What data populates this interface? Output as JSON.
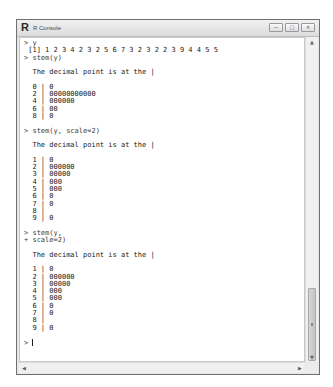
{
  "window": {
    "title": "R Console",
    "logo": "R",
    "controls": {
      "minimize": "—",
      "maximize": "□",
      "close": "✕"
    }
  },
  "console": {
    "lines": [
      {
        "type": "input",
        "text": "> y"
      },
      {
        "type": "output",
        "text": " [1] 1 2 3 4 2 3 2 5 6 7 3 2 3 2 2 3 9 4 4 5 5"
      },
      {
        "type": "input",
        "text": "> stem(y)"
      },
      {
        "type": "blank",
        "text": ""
      },
      {
        "type": "output",
        "text": "  The decimal point is at the |"
      },
      {
        "type": "blank",
        "text": ""
      },
      {
        "type": "output",
        "text": "  0 | 0"
      },
      {
        "type": "output",
        "text": "  2 | 00000000000"
      },
      {
        "type": "output",
        "text": "  4 | 000000"
      },
      {
        "type": "output",
        "text": "  6 | 00"
      },
      {
        "type": "output",
        "text": "  8 | 0"
      },
      {
        "type": "blank",
        "text": ""
      },
      {
        "type": "input",
        "text": "> stem(y, scale=2)"
      },
      {
        "type": "blank",
        "text": ""
      },
      {
        "type": "output",
        "text": "  The decimal point is at the |"
      },
      {
        "type": "blank",
        "text": ""
      },
      {
        "type": "output",
        "text": "  1 | 0"
      },
      {
        "type": "output",
        "text": "  2 | 000000"
      },
      {
        "type": "output",
        "text": "  3 | 00000"
      },
      {
        "type": "output",
        "text": "  4 | 000"
      },
      {
        "type": "output",
        "text": "  5 | 000"
      },
      {
        "type": "output",
        "text": "  6 | 0"
      },
      {
        "type": "output",
        "text": "  7 | 0"
      },
      {
        "type": "output",
        "text": "  8 |"
      },
      {
        "type": "output",
        "text": "  9 | 0"
      },
      {
        "type": "blank",
        "text": ""
      },
      {
        "type": "input",
        "text": "> stem(y,"
      },
      {
        "type": "input",
        "text": "+ scale=2)"
      },
      {
        "type": "blank",
        "text": ""
      },
      {
        "type": "output",
        "text": "  The decimal point is at the |"
      },
      {
        "type": "blank",
        "text": ""
      },
      {
        "type": "output",
        "text": "  1 | 0"
      },
      {
        "type": "output",
        "text": "  2 | 000000"
      },
      {
        "type": "output",
        "text": "  3 | 00000"
      },
      {
        "type": "output",
        "text": "  4 | 000"
      },
      {
        "type": "output",
        "text": "  5 | 000"
      },
      {
        "type": "output",
        "text": "  6 | 0"
      },
      {
        "type": "output",
        "text": "  7 | 0"
      },
      {
        "type": "output",
        "text": "  8 |"
      },
      {
        "type": "output",
        "text": "  9 | 0"
      },
      {
        "type": "blank",
        "text": ""
      }
    ],
    "prompt": "> "
  },
  "scrollbars": {
    "up": "▲",
    "down": "▼",
    "left": "◀",
    "right": "▶"
  }
}
